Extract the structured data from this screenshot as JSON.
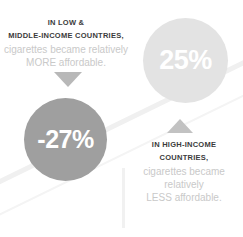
{
  "infographic": {
    "title_semantic": "cigarette-affordability-comparison",
    "colors": {
      "background": "#ffffff",
      "bubble_dark": "#9f9f9f",
      "bubble_light": "#e3e3e3",
      "text_strong": "#3b3b3b",
      "text_light": "#c9c9c9",
      "arrow_down": "#b8b8b8",
      "arrow_up": "#c2c2c2",
      "decoration": "#f0f0f0"
    },
    "left_block": {
      "heading_line1": "IN LOW &",
      "heading_line2": "MIDDLE-INCOME COUNTRIES,",
      "body_line1": "cigarettes became relatively",
      "body_line2": "MORE affordable.",
      "arrow_direction": "down",
      "bubble_value": "-27%"
    },
    "right_block": {
      "heading_line1": "IN HIGH-INCOME",
      "heading_line2": "COUNTRIES,",
      "body_line1": "cigarettes became",
      "body_line2": "relatively",
      "body_line3": "LESS affordable.",
      "arrow_direction": "up",
      "bubble_value": "25%"
    }
  },
  "chart_data": {
    "type": "bar",
    "categories": [
      "Low & middle-income countries",
      "High-income countries"
    ],
    "values": [
      -27,
      25
    ],
    "value_labels": [
      "-27%",
      "25%"
    ],
    "series": [
      {
        "name": "Change in affordability (%)",
        "values": [
          -27,
          25
        ]
      }
    ],
    "annotations": [
      "IN LOW & MIDDLE-INCOME COUNTRIES, cigarettes became relatively MORE affordable.",
      "IN HIGH-INCOME COUNTRIES, cigarettes became relatively LESS affordable."
    ],
    "xlabel": "",
    "ylabel": "Percent change",
    "ylim": [
      -30,
      30
    ],
    "grid": false,
    "legend": "none"
  }
}
